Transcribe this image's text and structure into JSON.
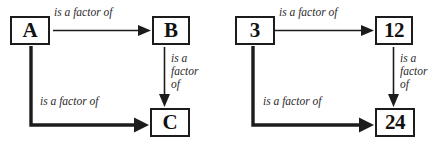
{
  "figure": {
    "background_color": "#ffffff",
    "ink_color": "#1c1c1c",
    "label_color": "#2a2a2a"
  },
  "diagrams": [
    {
      "id": "abstract",
      "nodes": {
        "source": "A",
        "middle": "B",
        "destination": "C"
      },
      "labels": {
        "source_to_middle": "is a factor of",
        "middle_to_destination_line1": "is a",
        "middle_to_destination_line2": "factor",
        "middle_to_destination_line3": "of",
        "source_to_destination": "is a factor of"
      }
    },
    {
      "id": "concrete",
      "nodes": {
        "source": "3",
        "middle": "12",
        "destination": "24"
      },
      "labels": {
        "source_to_middle": "is a factor of",
        "middle_to_destination_line1": "is a",
        "middle_to_destination_line2": "factor",
        "middle_to_destination_line3": "of",
        "source_to_destination": "is a factor of"
      }
    }
  ]
}
